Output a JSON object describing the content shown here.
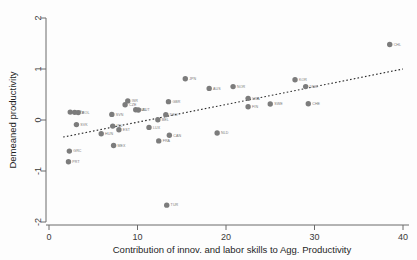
{
  "figure": {
    "background_color": "#fdfdfd",
    "marker_color": "#7c7c7c",
    "fit_line_color": "#2b2b2b",
    "axis_color": "#6b6b6b"
  },
  "chart_data": {
    "type": "scatter",
    "title": "",
    "xlabel": "Contribution of innov. and labor skills to Agg. Productivity",
    "ylabel": "Demeaned productivity",
    "xlim": [
      -1.5,
      41.5
    ],
    "ylim": [
      -2.15,
      2.15
    ],
    "xticks": [
      0,
      10,
      20,
      30,
      40
    ],
    "xtick_labels": [
      "0",
      "10",
      "20",
      "30",
      "40"
    ],
    "yticks": [
      2,
      1,
      0,
      -1,
      -2
    ],
    "ytick_labels": [
      "2",
      "1",
      "0",
      "-1",
      "-2"
    ],
    "grid": false,
    "legend": false,
    "fit_line": {
      "type": "linear-dotted",
      "x_start": 1.6,
      "y_start": -0.335,
      "x_end": 40.0,
      "y_end": 1.0,
      "style": "dotted"
    },
    "points": [
      {
        "label": "PRT",
        "x": 2.2,
        "y": -0.82
      },
      {
        "label": "GRC",
        "x": 2.3,
        "y": -0.61
      },
      {
        "label": "ESP",
        "x": 2.4,
        "y": 0.155
      },
      {
        "label": "ITA",
        "x": 2.9,
        "y": 0.15
      },
      {
        "label": "POL",
        "x": 3.3,
        "y": 0.145
      },
      {
        "label": "SVK",
        "x": 3.1,
        "y": -0.09
      },
      {
        "label": "HUN",
        "x": 5.9,
        "y": -0.27
      },
      {
        "label": "SVN",
        "x": 7.1,
        "y": 0.11
      },
      {
        "label": "IRL",
        "x": 7.2,
        "y": -0.12
      },
      {
        "label": "MEX",
        "x": 7.3,
        "y": -0.5
      },
      {
        "label": "EST",
        "x": 7.9,
        "y": -0.19
      },
      {
        "label": "CZE",
        "x": 8.6,
        "y": 0.3
      },
      {
        "label": "ISR",
        "x": 8.9,
        "y": 0.375
      },
      {
        "label": "NZL",
        "x": 9.8,
        "y": 0.2
      },
      {
        "label": "AUT",
        "x": 10.1,
        "y": 0.195
      },
      {
        "label": "LUX",
        "x": 11.3,
        "y": -0.145
      },
      {
        "label": "BEL",
        "x": 12.3,
        "y": 0.005
      },
      {
        "label": "FRA",
        "x": 12.4,
        "y": -0.41
      },
      {
        "label": "DEU",
        "x": 13.2,
        "y": 0.105
      },
      {
        "label": "CAN",
        "x": 13.6,
        "y": -0.3
      },
      {
        "label": "TUR",
        "x": 13.3,
        "y": -1.67
      },
      {
        "label": "GBR",
        "x": 13.5,
        "y": 0.36
      },
      {
        "label": "JPN",
        "x": 15.4,
        "y": 0.81
      },
      {
        "label": "AUS",
        "x": 18.1,
        "y": 0.62
      },
      {
        "label": "NLD",
        "x": 19.0,
        "y": -0.255
      },
      {
        "label": "NOR",
        "x": 20.8,
        "y": 0.655
      },
      {
        "label": "USA",
        "x": 22.5,
        "y": 0.425
      },
      {
        "label": "FIN",
        "x": 22.5,
        "y": 0.26
      },
      {
        "label": "SWE",
        "x": 25.0,
        "y": 0.315
      },
      {
        "label": "KOR",
        "x": 27.8,
        "y": 0.79
      },
      {
        "label": "DNK",
        "x": 29.0,
        "y": 0.655
      },
      {
        "label": "CHE",
        "x": 29.3,
        "y": 0.32
      },
      {
        "label": "CHL",
        "x": 38.5,
        "y": 1.48
      }
    ]
  }
}
